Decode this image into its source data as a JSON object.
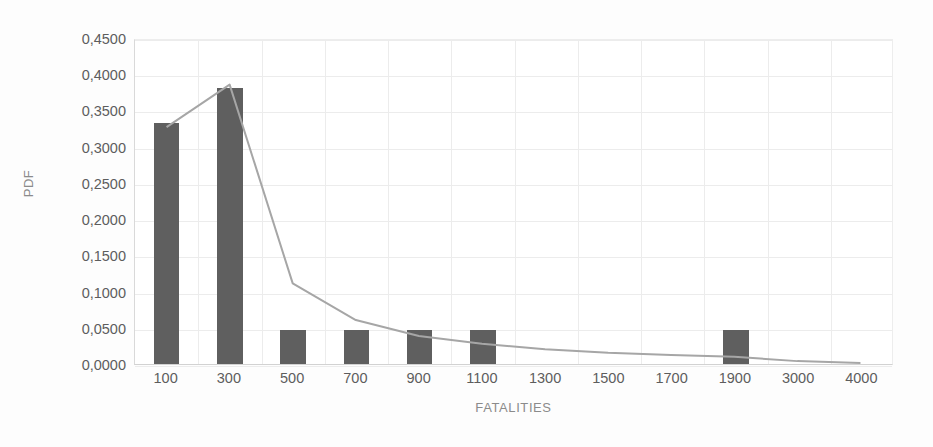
{
  "chart_data": {
    "type": "bar",
    "title": "",
    "xlabel": "FATALITIES",
    "ylabel": "PDF",
    "categories": [
      "100",
      "300",
      "500",
      "700",
      "900",
      "1100",
      "1300",
      "1500",
      "1700",
      "1900",
      "3000",
      "4000"
    ],
    "ylim": [
      0,
      0.45
    ],
    "y_tick_labels": [
      "0,4500",
      "0,4000",
      "0,3500",
      "0,3000",
      "0,2500",
      "0,2000",
      "0,1500",
      "0,1000",
      "0,0500",
      "0,0000"
    ],
    "y_tick_values": [
      0.45,
      0.4,
      0.35,
      0.3,
      0.25,
      0.2,
      0.15,
      0.1,
      0.05,
      0.0
    ],
    "grid": true,
    "legend": "none",
    "series": [
      {
        "name": "Histogram",
        "kind": "bar",
        "color": "#5f5f5f",
        "values": [
          0.3333,
          0.381,
          0.0476,
          0.0476,
          0.0476,
          0.0476,
          0.0,
          0.0,
          0.0,
          0.0476,
          0.0,
          0.0
        ]
      },
      {
        "name": "Fitted PDF",
        "kind": "line",
        "color": "#a6a6a6",
        "values": [
          0.329,
          0.388,
          0.112,
          0.061,
          0.039,
          0.028,
          0.0205,
          0.0155,
          0.0125,
          0.01,
          0.004,
          0.0015
        ]
      }
    ]
  }
}
